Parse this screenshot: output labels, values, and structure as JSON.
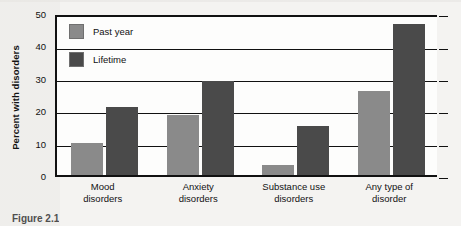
{
  "figure": {
    "caption": "Figure 2.1"
  },
  "chart_data": {
    "type": "bar",
    "title": "",
    "xlabel": "",
    "ylabel": "Percent with disorders",
    "ylim": [
      0,
      50
    ],
    "yticks": [
      0,
      10,
      20,
      30,
      40,
      50
    ],
    "grid": true,
    "legend_position": "top-left inside plot",
    "categories": [
      "Mood disorders",
      "Anxiety disorders",
      "Substance use disorders",
      "Any type of disorder"
    ],
    "category_lines": [
      [
        "Mood",
        "disorders"
      ],
      [
        "Anxiety",
        "disorders"
      ],
      [
        "Substance use",
        "disorders"
      ],
      [
        "Any type of",
        "disorder"
      ]
    ],
    "series": [
      {
        "name": "Past year",
        "color": "#8a8a8a",
        "values": [
          10,
          18.5,
          3,
          26
        ]
      },
      {
        "name": "Lifetime",
        "color": "#4a4a4a",
        "values": [
          21,
          29,
          15,
          46.5
        ]
      }
    ]
  }
}
